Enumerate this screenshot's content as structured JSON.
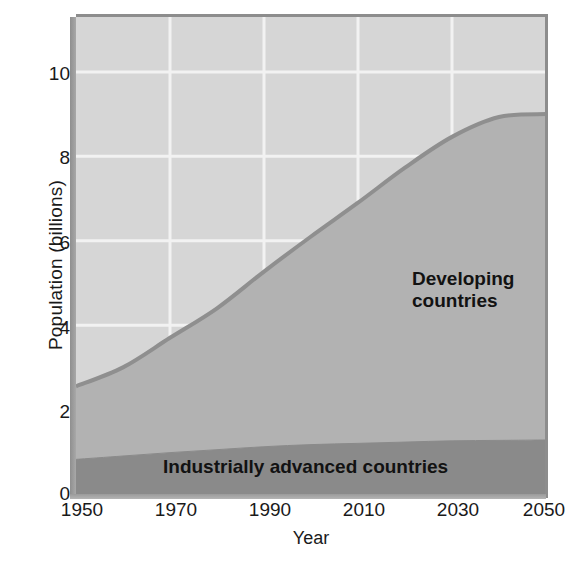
{
  "chart_data": {
    "type": "area",
    "title": "",
    "xlabel": "Year",
    "ylabel": "Population (billions)",
    "xlim": [
      1950,
      2050
    ],
    "ylim": [
      0,
      11.3
    ],
    "xticks": [
      1950,
      1970,
      1990,
      2010,
      2030,
      2050
    ],
    "yticks": [
      0,
      2,
      4,
      6,
      8,
      10
    ],
    "grid": true,
    "grid_color": "#f2f2f2",
    "legend_position": "inline-annotations",
    "stacked": true,
    "x": [
      1950,
      1960,
      1970,
      1980,
      1990,
      2000,
      2010,
      2020,
      2030,
      2040,
      2050
    ],
    "series": [
      {
        "name": "Industrially advanced countries",
        "color": "#8a8a8a",
        "values": [
          0.82,
          0.9,
          0.98,
          1.05,
          1.12,
          1.17,
          1.2,
          1.23,
          1.26,
          1.27,
          1.28
        ]
      },
      {
        "name": "Developing countries",
        "color": "#b2b2b2",
        "values": [
          1.73,
          2.1,
          2.72,
          3.35,
          4.15,
          4.93,
          5.7,
          6.5,
          7.2,
          7.66,
          7.72
        ]
      }
    ],
    "total_population": [
      2.55,
      3.0,
      3.7,
      4.4,
      5.27,
      6.1,
      6.9,
      7.73,
      8.46,
      8.93,
      9.0
    ],
    "curve_color": "#8f8f8f",
    "background_color": "#d6d6d6",
    "annotations": [
      {
        "text": "Developing",
        "x": 2001,
        "y": 5.1
      },
      {
        "text": "countries",
        "x": 2001,
        "y": 4.6
      },
      {
        "text": "Industrially advanced countries",
        "x": 1969,
        "y": 0.4
      }
    ]
  },
  "axes": {
    "ylabel": "Population (billions)",
    "xlabel": "Year",
    "ytick_labels": [
      "10",
      "8",
      "6",
      "4",
      "2",
      "0"
    ],
    "xtick_labels": [
      "1950",
      "1970",
      "1990",
      "2010",
      "2030",
      "2050"
    ]
  },
  "labels": {
    "developing_line1": "Developing",
    "developing_line2": "countries",
    "industrial": "Industrially advanced countries"
  }
}
